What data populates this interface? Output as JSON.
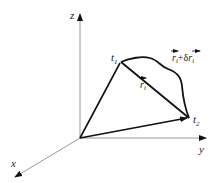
{
  "diagram": {
    "axes": {
      "x": {
        "label": "x"
      },
      "y": {
        "label": "y"
      },
      "z": {
        "label": "z"
      }
    },
    "points": {
      "t1": {
        "label": "t",
        "subscript": "1"
      },
      "t2": {
        "label": "t",
        "subscript": "2"
      }
    },
    "vectors": {
      "ri": {
        "label": "r",
        "subscript": "i"
      },
      "varied": {
        "label_r": "r",
        "sub1": "i",
        "plus_delta": "+δ",
        "label_r2": "r",
        "sub2": "i"
      }
    },
    "colors": {
      "axis": "#9a9a9a",
      "path": "#111111",
      "background": "#ffffff"
    }
  }
}
